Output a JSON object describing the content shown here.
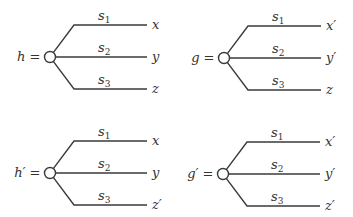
{
  "trees": [
    {
      "name": "h",
      "label": "h =",
      "cx": 50,
      "cy": 57,
      "branches": [
        {
          "signal": "s",
          "sub": "1",
          "outcome": "x"
        },
        {
          "signal": "s",
          "sub": "2",
          "outcome": "y"
        },
        {
          "signal": "s",
          "sub": "3",
          "outcome": "z"
        }
      ]
    },
    {
      "name": "g",
      "label": "g =",
      "cx": 224,
      "cy": 58,
      "branches": [
        {
          "signal": "s",
          "sub": "1",
          "outcome": "x′"
        },
        {
          "signal": "s",
          "sub": "2",
          "outcome": "y′"
        },
        {
          "signal": "s",
          "sub": "3",
          "outcome": "z"
        }
      ]
    },
    {
      "name": "h-prime",
      "label": "h′ =",
      "cx": 50,
      "cy": 173,
      "branches": [
        {
          "signal": "s",
          "sub": "1",
          "outcome": "x"
        },
        {
          "signal": "s",
          "sub": "2",
          "outcome": "y"
        },
        {
          "signal": "s",
          "sub": "3",
          "outcome": "z′"
        }
      ]
    },
    {
      "name": "g-prime",
      "label": "g′ =",
      "cx": 223,
      "cy": 174,
      "branches": [
        {
          "signal": "s",
          "sub": "1",
          "outcome": "x′"
        },
        {
          "signal": "s",
          "sub": "2",
          "outcome": "y′"
        },
        {
          "signal": "s",
          "sub": "3",
          "outcome": "z′"
        }
      ]
    }
  ]
}
